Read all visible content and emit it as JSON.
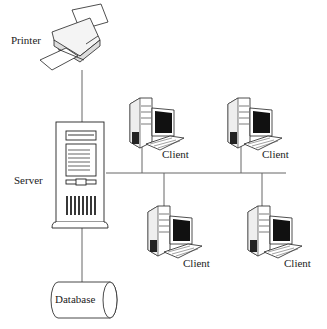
{
  "diagram": {
    "type": "network-topology",
    "nodes": [
      {
        "id": "printer",
        "label": "Printer",
        "icon": "printer-icon"
      },
      {
        "id": "server",
        "label": "Server",
        "icon": "server-tower-icon"
      },
      {
        "id": "database",
        "label": "Database",
        "icon": "database-cylinder-icon"
      },
      {
        "id": "client1",
        "label": "Client",
        "icon": "desktop-computer-icon"
      },
      {
        "id": "client2",
        "label": "Client",
        "icon": "desktop-computer-icon"
      },
      {
        "id": "client3",
        "label": "Client",
        "icon": "desktop-computer-icon"
      },
      {
        "id": "client4",
        "label": "Client",
        "icon": "desktop-computer-icon"
      }
    ],
    "edges": [
      {
        "from": "printer",
        "to": "server"
      },
      {
        "from": "server",
        "to": "database"
      },
      {
        "from": "server",
        "to": "bus"
      },
      {
        "from": "bus",
        "to": "client1"
      },
      {
        "from": "bus",
        "to": "client2"
      },
      {
        "from": "bus",
        "to": "client3"
      },
      {
        "from": "bus",
        "to": "client4"
      }
    ],
    "colors": {
      "line": "#555555",
      "stroke": "#222222",
      "screen": "#111111"
    }
  }
}
